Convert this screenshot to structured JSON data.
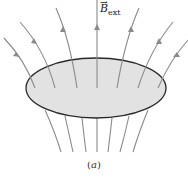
{
  "figure": {
    "vector_label": {
      "symbol": "B",
      "arrow": "→",
      "subscript": "ext"
    },
    "caption": {
      "open": "(",
      "letter": "a",
      "close": ")"
    },
    "colors": {
      "field_line": "#8a8a8a",
      "disk_fill": "#e2e2e2",
      "disk_outline": "#2a2a2a"
    },
    "field_line_count": 7
  }
}
